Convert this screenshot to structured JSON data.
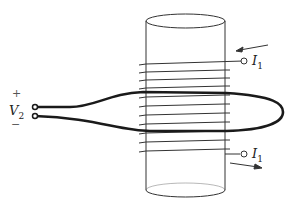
{
  "diagram": {
    "labels": {
      "plus": "+",
      "minus": "−",
      "voltage": "V",
      "voltage_sub": "2",
      "current_top": "I",
      "current_top_sub": "1",
      "current_bottom": "I",
      "current_bottom_sub": "1"
    },
    "colors": {
      "stroke": "#222222",
      "background": "#ffffff"
    },
    "coil_turns": 11
  }
}
